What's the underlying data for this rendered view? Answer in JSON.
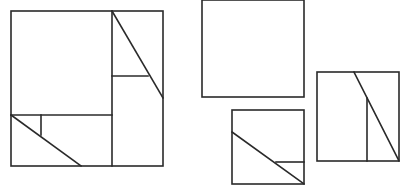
{
  "diagram": {
    "stroke_color": "#2a2a2a",
    "stroke_width": 1.6,
    "background": "#ffffff",
    "figures": [
      {
        "name": "dissected-square-large",
        "outline": {
          "x": 11,
          "y": 11,
          "w": 152,
          "h": 155
        },
        "lines": [
          {
            "name": "vertical-divider",
            "x1": 112,
            "y1": 11,
            "x2": 112,
            "y2": 166
          },
          {
            "name": "horizontal-divider",
            "x1": 11,
            "y1": 115,
            "x2": 112,
            "y2": 115
          },
          {
            "name": "upper-right-diagonal",
            "x1": 112,
            "y1": 11,
            "x2": 163,
            "y2": 98
          },
          {
            "name": "upper-right-horizontal",
            "x1": 112,
            "y1": 76,
            "x2": 148,
            "y2": 76
          },
          {
            "name": "lower-left-vertical",
            "x1": 41,
            "y1": 115,
            "x2": 41,
            "y2": 135
          },
          {
            "name": "lower-left-diagonal",
            "x1": 11,
            "y1": 115,
            "x2": 81,
            "y2": 166
          }
        ]
      },
      {
        "name": "plain-rectangle",
        "outline": {
          "x": 202,
          "y": 0,
          "w": 102,
          "h": 97
        },
        "lines": []
      },
      {
        "name": "small-square-diagonal",
        "outline": {
          "x": 232,
          "y": 110,
          "w": 72,
          "h": 74
        },
        "lines": [
          {
            "name": "diagonal",
            "x1": 232,
            "y1": 132,
            "x2": 304,
            "y2": 184
          },
          {
            "name": "short-horizontal",
            "x1": 276,
            "y1": 162,
            "x2": 304,
            "y2": 162
          }
        ]
      },
      {
        "name": "right-square-diagonal",
        "outline": {
          "x": 317,
          "y": 72,
          "w": 82,
          "h": 89
        },
        "lines": [
          {
            "name": "diagonal",
            "x1": 354,
            "y1": 72,
            "x2": 399,
            "y2": 161
          },
          {
            "name": "vertical",
            "x1": 367,
            "y1": 98,
            "x2": 367,
            "y2": 161
          }
        ]
      }
    ]
  }
}
